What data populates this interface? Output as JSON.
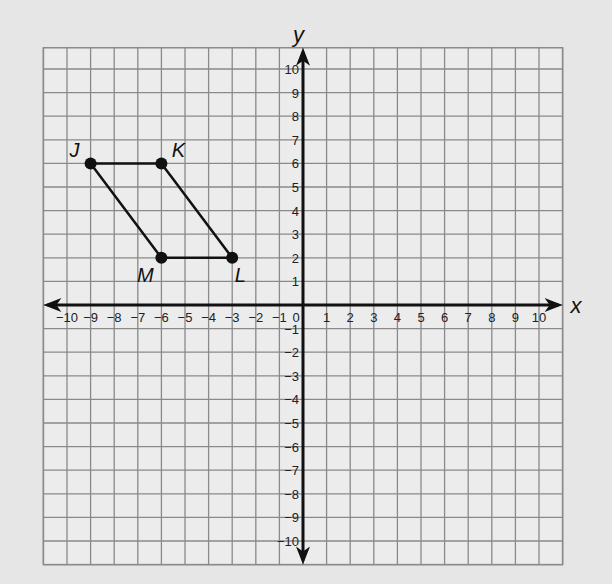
{
  "chart_data": {
    "type": "scatter",
    "title": "",
    "xlabel": "x",
    "ylabel": "y",
    "xlim": [
      -10,
      10
    ],
    "ylim": [
      -10,
      10
    ],
    "grid": true,
    "x_ticks": [
      -10,
      -9,
      -8,
      -7,
      -6,
      -5,
      -4,
      -3,
      -2,
      -1,
      0,
      1,
      2,
      3,
      4,
      5,
      6,
      7,
      8,
      9,
      10
    ],
    "y_ticks": [
      -10,
      -9,
      -8,
      -7,
      -6,
      -5,
      -4,
      -3,
      -2,
      -1,
      1,
      2,
      3,
      4,
      5,
      6,
      7,
      8,
      9,
      10
    ],
    "shape": "parallelogram JKLM",
    "points": [
      {
        "label": "J",
        "x": -9,
        "y": 6
      },
      {
        "label": "K",
        "x": -6,
        "y": 6
      },
      {
        "label": "L",
        "x": -3,
        "y": 2
      },
      {
        "label": "M",
        "x": -6,
        "y": 2
      }
    ],
    "edges": [
      [
        "J",
        "K"
      ],
      [
        "K",
        "L"
      ],
      [
        "L",
        "M"
      ],
      [
        "M",
        "J"
      ]
    ]
  },
  "colors": {
    "background": "#e6e6e6",
    "grid": "#8a8a8a",
    "axis": "#111111",
    "figure": "#111111"
  }
}
